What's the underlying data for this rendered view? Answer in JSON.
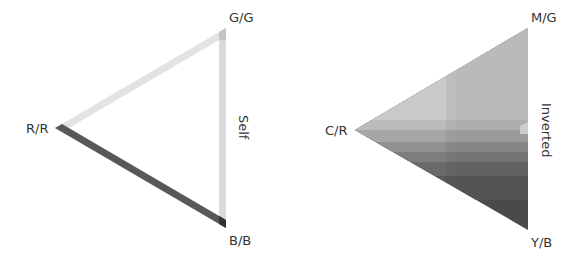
{
  "diagrams": [
    {
      "name": "self",
      "title": "Self",
      "vertices": {
        "top": "G/G",
        "left": "R/R",
        "bottom": "B/B"
      },
      "style": "outline-bands",
      "band_colors": {
        "top_edge": "#e2e2e2",
        "right_edge": "#d9d9d9",
        "bottom_edge": "#555555"
      }
    },
    {
      "name": "inverted",
      "title": "Inverted",
      "vertices": {
        "top": "M/G",
        "left": "C/R",
        "bottom": "Y/B"
      },
      "style": "filled-stepped-gradient",
      "step_colors": [
        "#cfcfcf",
        "#c2c2c2",
        "#b0b0b0",
        "#8e8e8e",
        "#777777",
        "#5c5c5c",
        "#505050"
      ]
    }
  ]
}
